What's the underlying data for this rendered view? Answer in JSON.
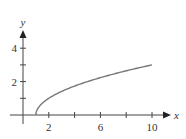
{
  "chart_data": {
    "type": "line",
    "title": "",
    "xlabel": "x",
    "ylabel": "y",
    "xlim": [
      -0.5,
      11.3
    ],
    "ylim": [
      -0.7,
      5.2
    ],
    "grid": false,
    "legend": null,
    "x_ticks": [
      2,
      4,
      6,
      8,
      10
    ],
    "x_tick_labels": [
      "2",
      "",
      "6",
      "",
      "10"
    ],
    "y_ticks": [
      1,
      2,
      3,
      4
    ],
    "y_tick_labels": [
      "",
      "2",
      "",
      "4"
    ],
    "function": "y = sqrt(x - 1)",
    "series": [
      {
        "name": "curve",
        "color": "#777777",
        "x": [
          1,
          1.25,
          1.5,
          2,
          3,
          4,
          5,
          6,
          7,
          8,
          9,
          10
        ],
        "y": [
          0,
          0.5,
          0.707,
          1,
          1.414,
          1.732,
          2,
          2.236,
          2.449,
          2.646,
          2.828,
          3
        ]
      }
    ]
  },
  "labels": {
    "x_axis": "x",
    "y_axis": "y",
    "x2": "2",
    "x6": "6",
    "x10": "10",
    "y2": "2",
    "y4": "4"
  }
}
